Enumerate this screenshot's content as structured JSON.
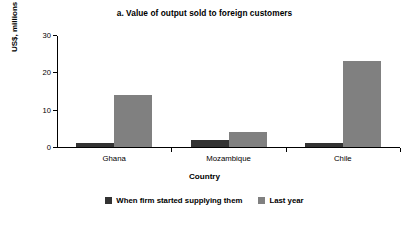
{
  "chart_data": {
    "type": "bar",
    "title": "a. Value of output sold to foreign customers",
    "xlabel": "Country",
    "ylabel": "US$, millions",
    "categories": [
      "Ghana",
      "Mozambique",
      "Chile"
    ],
    "series": [
      {
        "name": "When firm started supplying them",
        "color": "#333333",
        "values": [
          1,
          2,
          1
        ]
      },
      {
        "name": "Last year",
        "color": "#808080",
        "values": [
          14,
          4,
          23
        ]
      }
    ],
    "ylim": [
      0,
      30
    ],
    "yticks": [
      0,
      10,
      20,
      30
    ],
    "ytick_labels": [
      "0",
      "10",
      "20",
      "30"
    ],
    "grid": false,
    "legend_position": "bottom"
  },
  "colors": {
    "series_dark": "#333333",
    "series_light": "#808080",
    "axis": "#000000",
    "background": "#ffffff"
  }
}
